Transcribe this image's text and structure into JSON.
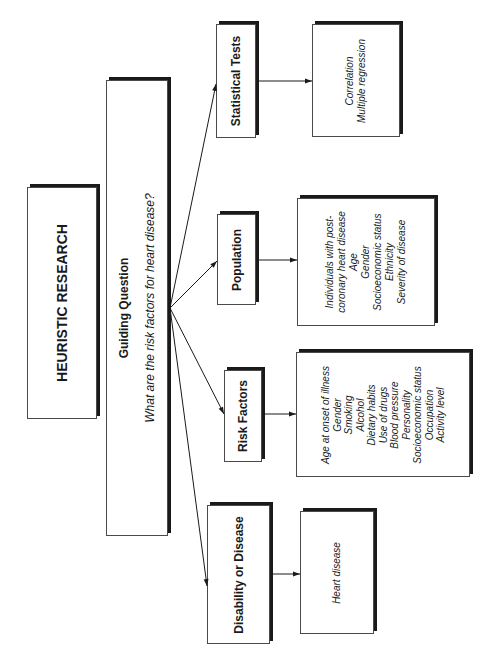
{
  "diagram": {
    "title": "HEURISTIC RESEARCH",
    "guiding_question": {
      "heading": "Guiding Question",
      "question": "What are the risk factors for heart disease?"
    },
    "branches": [
      {
        "label": "Statistical Tests",
        "items": [
          "Correlation",
          "Multiple regression"
        ]
      },
      {
        "label": "Population",
        "items": [
          "Individuals with post-",
          "coronary heart disease",
          "Age",
          "Gender",
          "Socioeconomic status",
          "Ethnicity",
          "Severity of disease"
        ]
      },
      {
        "label": "Risk Factors",
        "items": [
          "Age at onset of illness",
          "Gender",
          "Smoking",
          "Alcohol",
          "Dietary habits",
          "Use of drugs",
          "Blood pressure",
          "Personality",
          "Socioeconomic status",
          "Occupation",
          "Activity level"
        ]
      },
      {
        "label": "Disability or Disease",
        "items": [
          "Heart disease"
        ]
      }
    ],
    "colors": {
      "line": "#1a1a1a",
      "box_border": "#4a4a4a",
      "background": "#ffffff"
    }
  }
}
